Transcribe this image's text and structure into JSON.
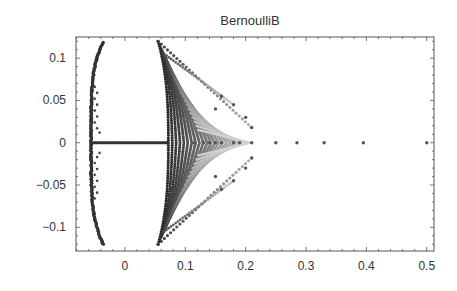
{
  "chart_data": {
    "type": "scatter",
    "title": "BernoulliB",
    "xlabel": "",
    "ylabel": "",
    "xlim": [
      -0.081,
      0.512
    ],
    "ylim": [
      -0.128,
      0.125
    ],
    "grid": false,
    "legend": null,
    "x_ticks": [
      0,
      0.1,
      0.2,
      0.3,
      0.4,
      0.5
    ],
    "x_tick_labels": [
      "0",
      "0.1",
      "0.2",
      "0.3",
      "0.4",
      "0.5"
    ],
    "y_ticks": [
      0.1,
      0.05,
      0,
      -0.05,
      -0.1
    ],
    "y_tick_labels": [
      "0.1",
      "0.05",
      "0",
      "−0.05",
      "−0.1"
    ],
    "series": [
      {
        "name": "left arc",
        "shape": "arc",
        "points": [
          [
            -0.035,
            0.12
          ],
          [
            -0.045,
            0.09
          ],
          [
            -0.052,
            0.06
          ],
          [
            -0.055,
            0.03
          ],
          [
            -0.053,
            0.0
          ],
          [
            -0.055,
            -0.03
          ],
          [
            -0.052,
            -0.06
          ],
          [
            -0.045,
            -0.09
          ],
          [
            -0.035,
            -0.12
          ]
        ]
      },
      {
        "name": "real axis segment",
        "shape": "line",
        "points": [
          [
            -0.053,
            0.0
          ],
          [
            0.07,
            0.0
          ]
        ]
      },
      {
        "name": "right arc",
        "shape": "arc",
        "points": [
          [
            0.055,
            0.12
          ],
          [
            0.065,
            0.09
          ],
          [
            0.07,
            0.06
          ],
          [
            0.072,
            0.03
          ],
          [
            0.072,
            0.0
          ],
          [
            0.072,
            -0.03
          ],
          [
            0.07,
            -0.06
          ],
          [
            0.065,
            -0.09
          ],
          [
            0.055,
            -0.12
          ]
        ]
      },
      {
        "name": "real-axis isolated zeros",
        "shape": "dots",
        "points": [
          [
            0.115,
            0
          ],
          [
            0.13,
            0
          ],
          [
            0.14,
            0
          ],
          [
            0.15,
            0
          ],
          [
            0.16,
            0
          ],
          [
            0.18,
            0
          ],
          [
            0.19,
            0
          ],
          [
            0.21,
            0
          ],
          [
            0.25,
            0
          ],
          [
            0.285,
            0
          ],
          [
            0.33,
            0
          ],
          [
            0.395,
            0
          ],
          [
            0.5,
            0
          ]
        ]
      },
      {
        "name": "fan endpoints (upper)",
        "shape": "dots",
        "points": [
          [
            0.21,
            0.018
          ],
          [
            0.2,
            0.03
          ],
          [
            0.18,
            0.045
          ],
          [
            0.15,
            0.04
          ],
          [
            0.16,
            0.055
          ]
        ]
      }
    ]
  }
}
